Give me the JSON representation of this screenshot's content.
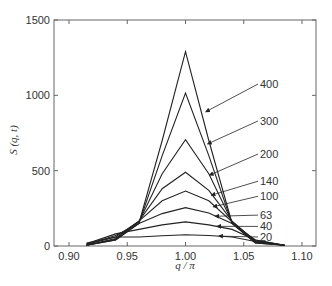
{
  "chart_data": {
    "type": "line",
    "title": "",
    "xlabel": "q / π",
    "ylabel": "S (q, t)",
    "xlim": [
      0.885,
      1.11
    ],
    "ylim": [
      0,
      1500
    ],
    "xticks": [
      0.9,
      0.95,
      1.0,
      1.05,
      1.1
    ],
    "xtick_labels": [
      "0.90",
      "0.95",
      "1.00",
      "1.05",
      "1.10"
    ],
    "yticks": [
      0,
      500,
      1000,
      1500
    ],
    "ytick_labels": [
      "0",
      "500",
      "1000",
      "1500"
    ],
    "grid": false,
    "legend": "inline arrow labels (time t)",
    "x": [
      0.915,
      0.94,
      0.96,
      0.98,
      1.0,
      1.02,
      1.04,
      1.06,
      1.085
    ],
    "series": [
      {
        "name": "400",
        "values": [
          5,
          40,
          150,
          700,
          1290,
          700,
          150,
          20,
          5
        ],
        "label_pos": [
          0.115,
          1075
        ]
      },
      {
        "name": "300",
        "values": [
          5,
          40,
          150,
          600,
          1015,
          600,
          150,
          20,
          5
        ],
        "label_pos": [
          0.115,
          830
        ]
      },
      {
        "name": "200",
        "values": [
          5,
          45,
          160,
          480,
          705,
          480,
          160,
          25,
          5
        ],
        "label_pos": [
          0.115,
          610
        ]
      },
      {
        "name": "140",
        "values": [
          5,
          50,
          165,
          380,
          490,
          370,
          165,
          30,
          5
        ],
        "label_pos": [
          0.115,
          430
        ]
      },
      {
        "name": "100",
        "values": [
          10,
          60,
          165,
          300,
          365,
          300,
          160,
          35,
          5
        ],
        "label_pos": [
          0.115,
          330
        ]
      },
      {
        "name": "63",
        "values": [
          10,
          70,
          150,
          215,
          255,
          220,
          150,
          40,
          5
        ],
        "label_pos": [
          0.115,
          205
        ]
      },
      {
        "name": "40",
        "values": [
          15,
          80,
          110,
          140,
          160,
          140,
          110,
          40,
          5
        ],
        "label_pos": [
          0.115,
          130
        ]
      },
      {
        "name": "20",
        "values": [
          20,
          60,
          60,
          68,
          75,
          70,
          60,
          30,
          5
        ],
        "label_pos": [
          0.115,
          60
        ]
      }
    ]
  },
  "caption": "Fig. 9.4  Structure factor S(q, t) ..."
}
